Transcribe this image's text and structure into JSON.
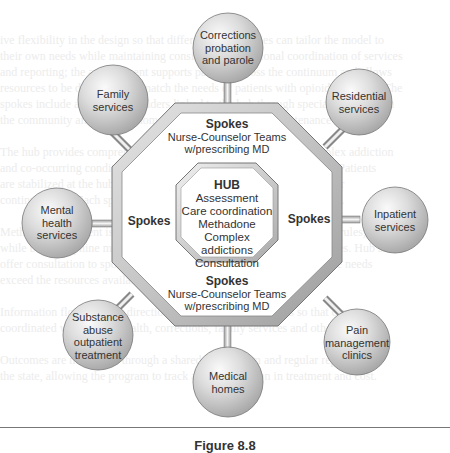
{
  "hub": {
    "title": "HUB",
    "lines": [
      "Assessment",
      "Care coordination",
      "Methadone",
      "Complex addictions",
      "Consultation"
    ]
  },
  "spokes": {
    "top": {
      "title": "Spokes",
      "line1": "Nurse-Counselor Teams",
      "line2": "w/prescribing MD"
    },
    "bottom": {
      "title": "Spokes",
      "line1": "Nurse-Counselor Teams",
      "line2": "w/prescribing MD"
    },
    "left": {
      "title": "Spokes"
    },
    "right": {
      "title": "Spokes"
    }
  },
  "nodes": [
    {
      "id": "corrections",
      "lines": [
        "Corrections",
        "probation",
        "and parole"
      ]
    },
    {
      "id": "residential",
      "lines": [
        "Residential",
        "services"
      ]
    },
    {
      "id": "inpatient",
      "lines": [
        "Inpatient",
        "services"
      ]
    },
    {
      "id": "pain",
      "lines": [
        "Pain",
        "management",
        "clinics"
      ]
    },
    {
      "id": "medical",
      "lines": [
        "Medical",
        "homes"
      ]
    },
    {
      "id": "substance",
      "lines": [
        "Substance",
        "abuse",
        "outpatient",
        "treatment"
      ]
    },
    {
      "id": "mental",
      "lines": [
        "Mental",
        "health",
        "services"
      ]
    },
    {
      "id": "family",
      "lines": [
        "Family",
        "services"
      ]
    }
  ],
  "caption": "Figure 8.8"
}
